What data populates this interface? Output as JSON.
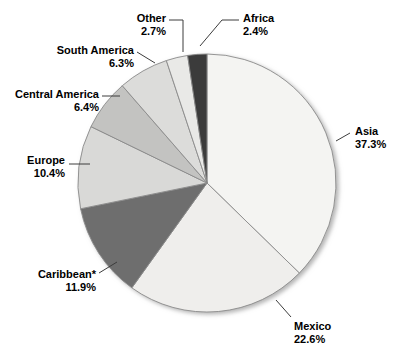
{
  "chart_data": {
    "type": "pie",
    "title": "",
    "subtitle": "",
    "xlabel": "",
    "ylabel": "",
    "legend_position": "none",
    "grid": false,
    "start_angle_deg": 0,
    "direction": "clockwise",
    "footnote": "",
    "categories": [
      "Asia",
      "Mexico",
      "Caribbean*",
      "Europe",
      "Central America",
      "South America",
      "Other",
      "Africa"
    ],
    "values": [
      37.3,
      22.6,
      11.9,
      10.4,
      6.4,
      6.3,
      2.7,
      2.4
    ],
    "slices": [
      {
        "name": "Asia",
        "label": "Asia",
        "percent": 37.3,
        "percent_text": "37.3%",
        "color": "#f4f4f2",
        "label_align": "left",
        "label_x": 355,
        "label_y": 125,
        "leader": [
          [
            336,
            141
          ],
          [
            350,
            133
          ]
        ]
      },
      {
        "name": "Mexico",
        "label": "Mexico",
        "percent": 22.6,
        "percent_text": "22.6%",
        "color": "#efeeec",
        "label_align": "left",
        "label_x": 294,
        "label_y": 320,
        "leader": [
          [
            276,
            300
          ],
          [
            291,
            317
          ]
        ]
      },
      {
        "name": "Caribbean*",
        "label": "Caribbean*",
        "percent": 11.9,
        "percent_text": "11.9%",
        "color": "#6e6e6e",
        "label_align": "right",
        "label_x": 96,
        "label_y": 268,
        "leader": [
          [
            99,
            273
          ],
          [
            117,
            262
          ]
        ]
      },
      {
        "name": "Europe",
        "label": "Europe",
        "percent": 10.4,
        "percent_text": "10.4%",
        "color": "#d9d9d7",
        "label_align": "right",
        "label_x": 65,
        "label_y": 154,
        "leader": [
          [
            69,
            164
          ],
          [
            90,
            164
          ]
        ]
      },
      {
        "name": "Central America",
        "label": "Central America",
        "percent": 6.4,
        "percent_text": "6.4%",
        "color": "#c3c3c1",
        "label_align": "right",
        "label_x": 99,
        "label_y": 88,
        "leader": [
          [
            102,
            96
          ],
          [
            120,
            96
          ]
        ]
      },
      {
        "name": "South America",
        "label": "South America",
        "percent": 6.3,
        "percent_text": "6.3%",
        "color": "#dcdcda",
        "label_align": "right",
        "label_x": 134,
        "label_y": 44,
        "leader": [
          [
            137,
            52
          ],
          [
            155,
            63
          ]
        ]
      },
      {
        "name": "Other",
        "label": "Other",
        "percent": 2.7,
        "percent_text": "2.7%",
        "color": "#e9e9e7",
        "label_align": "right",
        "label_x": 166,
        "label_y": 12,
        "leader": [
          [
            169,
            20
          ],
          [
            183,
            20
          ],
          [
            183,
            52
          ]
        ]
      },
      {
        "name": "Africa",
        "label": "Africa",
        "percent": 2.4,
        "percent_text": "2.4%",
        "color": "#3a3a3a",
        "label_align": "left",
        "label_x": 243,
        "label_y": 12,
        "leader": [
          [
            239,
            20
          ],
          [
            222,
            20
          ],
          [
            200,
            46
          ]
        ]
      }
    ],
    "geometry": {
      "center_x": 207,
      "center_y": 183,
      "radius": 129
    },
    "colors": {
      "background": "#ffffff",
      "slice_outline": "#8a8a8a",
      "text": "#000000",
      "leader_line": "#3c3c3c"
    }
  }
}
